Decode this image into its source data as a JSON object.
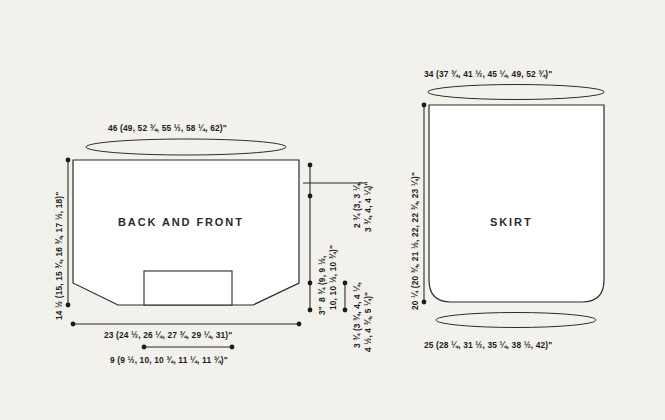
{
  "diagram": {
    "background_color": "#f2f1ec",
    "line_color": "#2b2b2b",
    "text_color": "#1c1c1c",
    "unit": "inches"
  },
  "panels": [
    {
      "id": "back-and-front",
      "label": "BACK AND FRONT"
    },
    {
      "id": "skirt",
      "label": "SKIRT"
    }
  ],
  "measurements": {
    "back_front_top_width": "46 (49, 52 ¾, 55 ½, 58 ¼, 62)\"",
    "back_front_left_height": "14 ½ (15, 15 ¾, 16 ¾, 17 ½, 18)\"",
    "back_front_bottom_width": "23 (24 ½, 26 ¼, 27 ¾, 29 ¼, 31)\"",
    "back_front_slit_width": "9 (9 ½, 10, 10 ¾, 11 ¼, 11 ¾)\"",
    "back_front_side_height_line1": "8 ¾ (9, 9 ½,",
    "back_front_side_height_line2": "10, 10 ½, 10 ¾)\"",
    "back_front_hem_height": "3\"",
    "back_front_shoulder_line1": "2 ¾ (3, 3 ¼,",
    "back_front_shoulder_line2": "3 ¾, 4, 4 ¼)\"",
    "back_front_armhole_line1": "3 ¾ (3 ¾, 4, 4 ¼,",
    "back_front_armhole_line2": "4 ½, 4 ¾, 5 ¼)\"",
    "skirt_top_width": "34 (37 ¾, 41 ½, 45 ¼, 49, 52 ¾)\"",
    "skirt_left_height": "20 ¼ (20 ¾, 21 ½, 22, 22 ¾, 23 ¼)\"",
    "skirt_bottom_width": "25 (28 ¼, 31 ½, 35 ¼, 38 ½, 42)\""
  }
}
